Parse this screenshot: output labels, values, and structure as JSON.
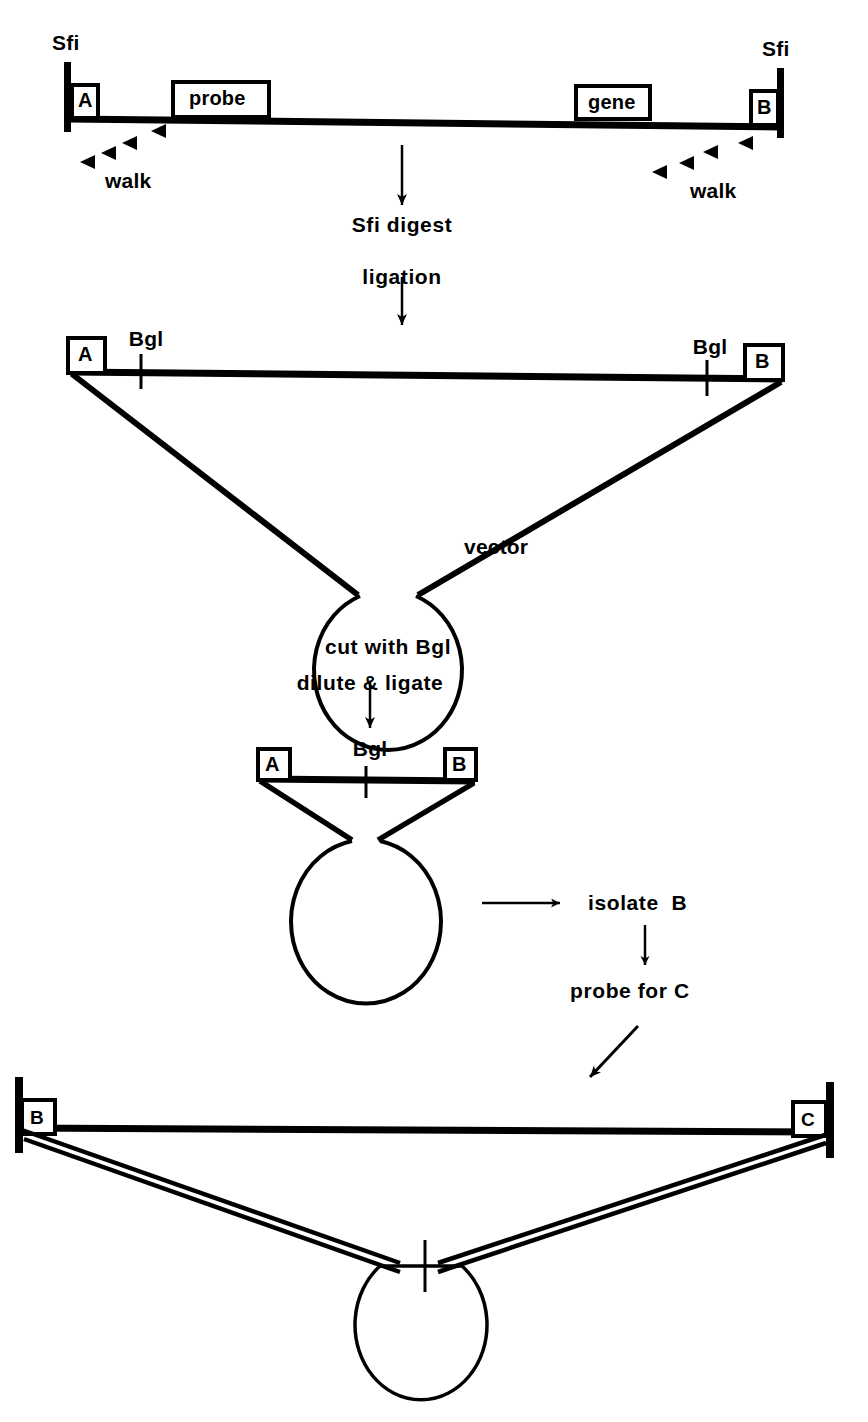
{
  "figure": {
    "ink_color": "#000000",
    "background_color": "#ffffff"
  },
  "step1": {
    "left_site_label": "Sfi",
    "right_site_label": "Sfi",
    "segment_a_label": "A",
    "segment_b_label": "B",
    "probe_label": "probe",
    "gene_label": "gene",
    "walk_left_label": "walk",
    "walk_right_label": "walk",
    "walk_left_arrowhead_count": 4,
    "walk_right_arrowhead_count": 4
  },
  "transition1": {
    "step_label_1": "Sfi digest",
    "step_label_2": "ligation"
  },
  "step2": {
    "segment_a_label": "A",
    "segment_b_label": "B",
    "bgl_left_label": "Bgl",
    "bgl_right_label": "Bgl",
    "vector_label": "vector",
    "caption": "cut with Bgl"
  },
  "transition2": {
    "step_label": "dilute & ligate"
  },
  "step3": {
    "segment_a_label": "A",
    "segment_b_label": "B",
    "bgl_label": "Bgl"
  },
  "branch": {
    "isolate_label": "isolate  B",
    "probe_label": "probe for C"
  },
  "step4": {
    "segment_b_label": "B",
    "segment_c_label": "C"
  }
}
